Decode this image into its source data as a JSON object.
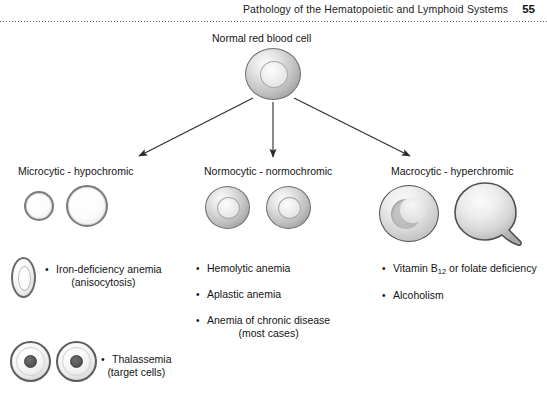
{
  "header": {
    "running_title": "Pathology of the Hematopoietic and Lymphoid Systems",
    "page_number": "55"
  },
  "diagram": {
    "root_label": "Normal red blood cell",
    "branches": [
      {
        "id": "microcytic",
        "label": "Microcytic - hypochromic",
        "conditions": [
          {
            "text": "Iron-deficiency anemia",
            "subtext": "(anisocytosis)"
          },
          {
            "text": "Thalassemia",
            "subtext": "(target cells)"
          }
        ]
      },
      {
        "id": "normocytic",
        "label": "Normocytic - normochromic",
        "conditions": [
          {
            "text": "Hemolytic anemia",
            "subtext": ""
          },
          {
            "text": "Aplastic anemia",
            "subtext": ""
          },
          {
            "text": "Anemia of chronic disease",
            "subtext": "(most cases)"
          }
        ]
      },
      {
        "id": "macrocytic",
        "label": "Macrocytic - hyperchromic",
        "conditions": [
          {
            "text": "Vitamin B12 or folate deficiency",
            "subtext": ""
          },
          {
            "text": "Alcoholism",
            "subtext": ""
          }
        ]
      }
    ],
    "vitamin_b12": {
      "prefix": "Vitamin B",
      "subscript": "12",
      "suffix": " or folate deficiency"
    },
    "cells": {
      "normal_rbc": "normal-red-blood-cell-icon",
      "microcytic_small": "microcytic-hypochromic-cell-small-icon",
      "microcytic_large": "microcytic-hypochromic-cell-large-icon",
      "normocytic_left": "normocytic-cell-left-icon",
      "normocytic_right": "normocytic-cell-right-icon",
      "macrocytic_round": "macrocytic-cell-icon",
      "macrocytic_teardrop": "teardrop-cell-icon",
      "elliptocyte": "elliptocyte-pencil-cell-icon",
      "target_cell_left": "target-cell-left-icon",
      "target_cell_right": "target-cell-right-icon"
    },
    "arrows": [
      "arrow-to-microcytic",
      "arrow-to-normocytic",
      "arrow-to-macrocytic"
    ]
  },
  "colors": {
    "ink": "#141414",
    "rule": "#555555",
    "cell_outline": "#5c5c5c",
    "cell_fill_light": "#f7f7f7",
    "cell_fill_mid": "#d2d2d2",
    "cell_fill_dark": "#8c8c8c",
    "page_background": "#ffffff"
  }
}
